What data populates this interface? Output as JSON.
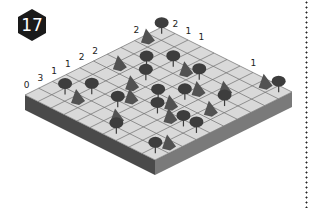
{
  "puzzle": {
    "number": "17",
    "grid_size": 10,
    "row_clues": [
      "0",
      "3",
      "1",
      "1",
      "2",
      "2",
      "",
      "",
      "2",
      ""
    ],
    "col_clues_right": [
      "2",
      "1",
      "1",
      "",
      "",
      "",
      "1",
      "",
      "",
      ""
    ],
    "colors": {
      "badge": "#1a1a1a",
      "cell": "#d9d9d9",
      "grid_line": "#6e6e6e",
      "side_left": "#4a4a4a",
      "side_right": "#7a7a7a",
      "tree": "#3d3d3d",
      "tent": "#525252"
    },
    "trees": [
      [
        0,
        0
      ],
      [
        2,
        3
      ],
      [
        2,
        5
      ],
      [
        4,
        3
      ],
      [
        4,
        6
      ],
      [
        5,
        5
      ],
      [
        6,
        6
      ],
      [
        7,
        2
      ],
      [
        7,
        4
      ],
      [
        8,
        1
      ],
      [
        9,
        6
      ],
      [
        0,
        9
      ],
      [
        3,
        8
      ],
      [
        6,
        8
      ],
      [
        6,
        9
      ],
      [
        9,
        9
      ],
      [
        3,
        2
      ]
    ],
    "tents": [
      [
        1,
        0
      ],
      [
        2,
        4
      ],
      [
        3,
        6
      ],
      [
        5,
        3
      ],
      [
        5,
        6
      ],
      [
        6,
        4
      ],
      [
        8,
        2
      ],
      [
        8,
        5
      ],
      [
        0,
        8
      ],
      [
        4,
        8
      ],
      [
        6,
        7
      ],
      [
        8,
        9
      ],
      [
        4,
        1
      ],
      [
        2,
        7
      ]
    ]
  }
}
